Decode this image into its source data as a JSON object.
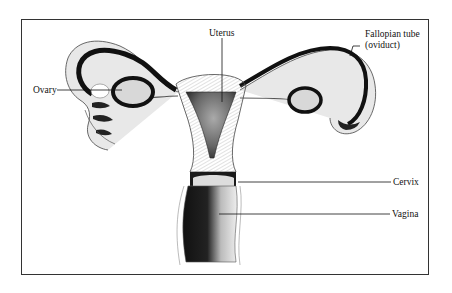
{
  "diagram": {
    "labels": {
      "uterus": "Uterus",
      "fallopian_tube_line1": "Fallopian tube",
      "fallopian_tube_line2": "(oviduct)",
      "ovary": "Ovary",
      "cervix": "Cervix",
      "vagina": "Vagina"
    },
    "colors": {
      "ink": "#111111",
      "frame": "#333333",
      "background": "#ffffff"
    }
  }
}
